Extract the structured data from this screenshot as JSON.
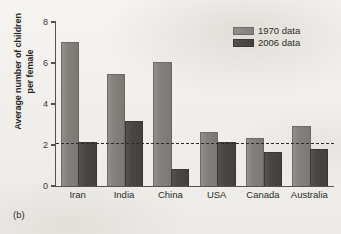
{
  "figure": {
    "panel_label": "(b)",
    "background_color": "#f3f1ee"
  },
  "legend": {
    "position": "top-right",
    "entries": [
      {
        "label": "1970 data",
        "color": "#84817d",
        "swatch_name": "legend-swatch-1970"
      },
      {
        "label": "2006 data",
        "color": "#46443f",
        "swatch_name": "legend-swatch-2006"
      }
    ]
  },
  "axes": {
    "y_title_line1": "Average number of children",
    "y_title_line2": "per female",
    "y_ticks": [
      "0",
      "2",
      "4",
      "6",
      "8"
    ],
    "x_labels": [
      "Iran",
      "India",
      "China",
      "USA",
      "Canada",
      "Australia"
    ]
  },
  "annotations": {
    "reference_line_value": 2.1,
    "reference_line_style": "dashed"
  },
  "chart_data": {
    "type": "bar",
    "title": "",
    "subtitle": "",
    "xlabel": "",
    "ylabel": "Average number of children per female",
    "categories": [
      "Iran",
      "India",
      "China",
      "USA",
      "Canada",
      "Australia"
    ],
    "series": [
      {
        "name": "1970 data",
        "color": "#84817d",
        "values": [
          7.0,
          5.4,
          6.0,
          2.6,
          2.3,
          2.9
        ]
      },
      {
        "name": "2006 data",
        "color": "#46443f",
        "values": [
          2.1,
          3.1,
          0.8,
          2.1,
          1.6,
          1.75
        ]
      }
    ],
    "ylim": [
      0,
      8
    ],
    "yticks": [
      0,
      2,
      4,
      6,
      8
    ],
    "grid": false,
    "legend_position": "top right",
    "annotations": [
      {
        "type": "hline",
        "y": 2.1,
        "style": "dashed",
        "label": ""
      }
    ]
  }
}
